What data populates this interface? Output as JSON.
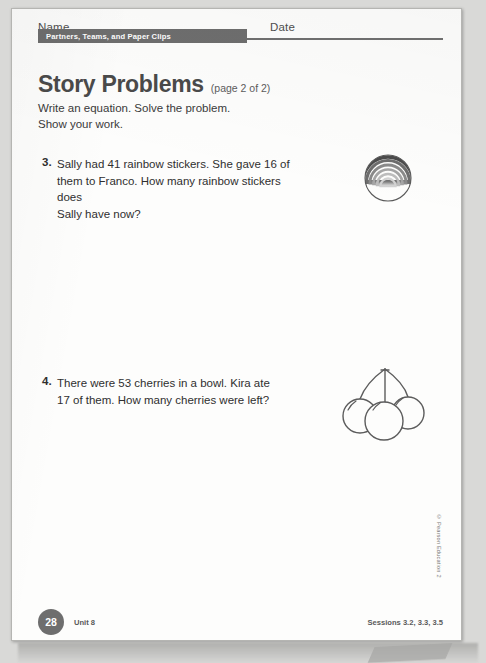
{
  "page": {
    "header": {
      "name_label": "Name",
      "date_label": "Date",
      "banner_title": "Partners, Teams, and Paper Clips"
    },
    "title": {
      "main": "Story Problems",
      "sub": "(page 2 of 2)",
      "instructions": "Write an equation. Solve the problem.\nShow your work."
    },
    "problems": [
      {
        "number": "3.",
        "text": "Sally had 41 rainbow stickers. She gave 16 of\nthem to Franco. How many rainbow stickers does\nSally have now?",
        "illustration": "rainbow-sticker-icon"
      },
      {
        "number": "4.",
        "text": "There were 53 cherries in a bowl. Kira ate\n17 of them. How many cherries were left?",
        "illustration": "cherries-icon"
      }
    ],
    "footer": {
      "page_number": "28",
      "unit": "Unit 8",
      "sessions": "Sessions 3.2, 3.3, 3.5",
      "copyright": "© Pearson Education 2"
    },
    "colors": {
      "banner_gray": "#6e6e6e",
      "title_gray": "#4a4a4a",
      "body_text": "#2f2f2f",
      "page_background": "#fdfdfc",
      "scan_background": "#d9d9d7"
    }
  }
}
